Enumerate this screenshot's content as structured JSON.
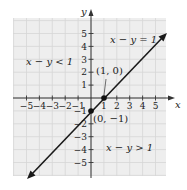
{
  "figure": {
    "type": "linear-inequality-graph",
    "axes": {
      "x_label": "x",
      "y_label": "y",
      "x_ticks": [
        "−5",
        "−4",
        "−3",
        "−2",
        "−1",
        "1",
        "2",
        "3",
        "4",
        "5"
      ],
      "y_ticks": [
        "5",
        "4",
        "3",
        "2",
        "1",
        "−1",
        "−2",
        "−3",
        "−4",
        "−5"
      ],
      "x_tick_values": [
        -5,
        -4,
        -3,
        -2,
        -1,
        1,
        2,
        3,
        4,
        5
      ],
      "y_tick_values": [
        5,
        4,
        3,
        2,
        1,
        -1,
        -2,
        -3,
        -4,
        -5
      ]
    },
    "line": {
      "equation_label": "x − y = 1",
      "color": "#1a1a1a"
    },
    "points": [
      {
        "label": "(1, 0)",
        "x": 1,
        "y": 0
      },
      {
        "label": "(0, −1)",
        "x": 0,
        "y": -1
      }
    ],
    "regions": {
      "upper_left": "x − y < 1",
      "lower_right": "x − y > 1"
    },
    "colors": {
      "grid_background": "#eeeeee",
      "grid_lines": "#d4d4d4",
      "axis": "#333333"
    }
  }
}
